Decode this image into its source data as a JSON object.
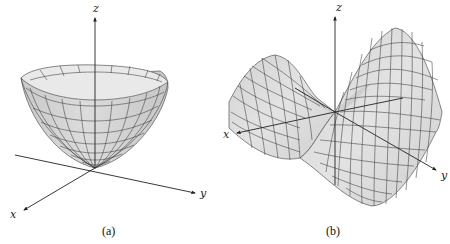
{
  "figure": {
    "panels": [
      {
        "id": "a",
        "caption": "(a)",
        "surface": "elliptic paraboloid (bowl)",
        "axes": {
          "x": "x",
          "y": "y",
          "z": "z"
        }
      },
      {
        "id": "b",
        "caption": "(b)",
        "surface": "hyperbolic paraboloid (saddle)",
        "axes": {
          "x": "x",
          "y": "y",
          "z": "z"
        }
      }
    ]
  },
  "colors": {
    "surface_fill": "#d9d9d9",
    "surface_fill_light": "#ececec",
    "grid_line": "#3a3a3a",
    "axis": "#222222",
    "background": "#ffffff"
  }
}
